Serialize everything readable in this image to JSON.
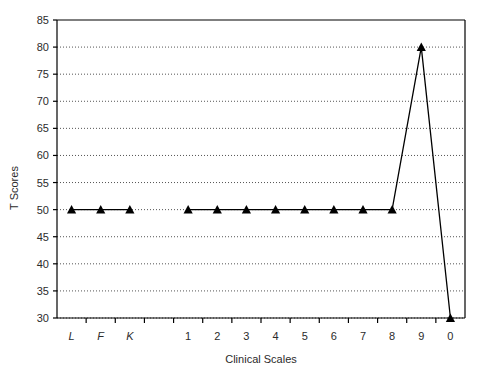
{
  "chart_data": {
    "type": "line",
    "title": "",
    "xlabel": "Clinical Scales",
    "ylabel": "T Scores",
    "ylim": [
      30,
      85
    ],
    "ytick_step": 5,
    "yticks": [
      30,
      35,
      40,
      45,
      50,
      55,
      60,
      65,
      70,
      75,
      80,
      85
    ],
    "grid": true,
    "grid_style": "dotted-horizontal",
    "legend": "none",
    "marker": "filled-triangle",
    "line_color": "#000000",
    "marker_color": "#000000",
    "grid_color": "#555555",
    "axis_color": "#000000",
    "background": "#ffffff",
    "categories": [
      "L",
      "F",
      "K",
      "",
      "1",
      "2",
      "3",
      "4",
      "5",
      "6",
      "7",
      "8",
      "9",
      "0"
    ],
    "category_styles": [
      "italic",
      "italic",
      "italic",
      "none",
      "none",
      "none",
      "none",
      "none",
      "none",
      "none",
      "none",
      "none",
      "none",
      "none"
    ],
    "values": [
      50,
      50,
      50,
      null,
      50,
      50,
      50,
      50,
      50,
      50,
      50,
      50,
      80,
      30
    ],
    "series": [
      {
        "name": "T Score Profile",
        "points": [
          {
            "category": "L",
            "value": 50
          },
          {
            "category": "F",
            "value": 50
          },
          {
            "category": "K",
            "value": 50
          },
          {
            "category": "",
            "value": null
          },
          {
            "category": "1",
            "value": 50
          },
          {
            "category": "2",
            "value": 50
          },
          {
            "category": "3",
            "value": 50
          },
          {
            "category": "4",
            "value": 50
          },
          {
            "category": "5",
            "value": 50
          },
          {
            "category": "6",
            "value": 50
          },
          {
            "category": "7",
            "value": 50
          },
          {
            "category": "8",
            "value": 50
          },
          {
            "category": "9",
            "value": 80
          },
          {
            "category": "0",
            "value": 30
          }
        ]
      }
    ]
  }
}
